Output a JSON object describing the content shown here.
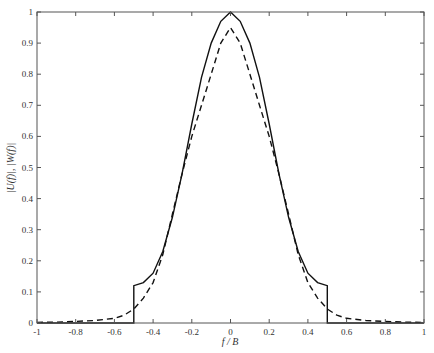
{
  "chart_data": {
    "type": "line",
    "title": "",
    "xlabel": "f / B",
    "ylabel": "|U(f)|, |W(f)|",
    "xlim": [
      -1,
      1
    ],
    "ylim": [
      0,
      1
    ],
    "grid": false,
    "legend": null,
    "xticks": [
      -1,
      -0.8,
      -0.6,
      -0.4,
      -0.2,
      0,
      0.2,
      0.4,
      0.6,
      0.8,
      1
    ],
    "xtick_labels": [
      "-1",
      "-0.8",
      "-0.6",
      "-0.4",
      "-0.2",
      "0",
      "0.2",
      "0.4",
      "0.6",
      "0.8",
      "1"
    ],
    "yticks": [
      0,
      0.1,
      0.2,
      0.3,
      0.4,
      0.5,
      0.6,
      0.7,
      0.8,
      0.9,
      1
    ],
    "ytick_labels": [
      "0",
      "0.1",
      "0.2",
      "0.3",
      "0.4",
      "0.5",
      "0.6",
      "0.7",
      "0.8",
      "0.9",
      "1"
    ],
    "series": [
      {
        "name": "|U(f)|",
        "style": "solid",
        "x": [
          -1,
          -0.5,
          -0.5,
          -0.45,
          -0.4,
          -0.35,
          -0.3,
          -0.25,
          -0.2,
          -0.15,
          -0.1,
          -0.05,
          0,
          0.05,
          0.1,
          0.15,
          0.2,
          0.25,
          0.3,
          0.35,
          0.4,
          0.45,
          0.5,
          0.5,
          1
        ],
        "values": [
          0,
          0,
          0.12,
          0.13,
          0.16,
          0.23,
          0.34,
          0.48,
          0.64,
          0.79,
          0.9,
          0.97,
          1.0,
          0.97,
          0.9,
          0.79,
          0.64,
          0.48,
          0.34,
          0.23,
          0.16,
          0.13,
          0.12,
          0,
          0
        ]
      },
      {
        "name": "|W(f)|",
        "style": "dashed",
        "x": [
          -1,
          -0.9,
          -0.8,
          -0.7,
          -0.6,
          -0.55,
          -0.5,
          -0.45,
          -0.4,
          -0.35,
          -0.3,
          -0.25,
          -0.2,
          -0.15,
          -0.1,
          -0.05,
          0,
          0.05,
          0.1,
          0.15,
          0.2,
          0.25,
          0.3,
          0.35,
          0.4,
          0.45,
          0.5,
          0.55,
          0.6,
          0.7,
          0.8,
          0.9,
          1
        ],
        "values": [
          0.002,
          0.003,
          0.005,
          0.008,
          0.015,
          0.025,
          0.045,
          0.08,
          0.13,
          0.22,
          0.35,
          0.48,
          0.6,
          0.7,
          0.8,
          0.9,
          0.95,
          0.9,
          0.8,
          0.7,
          0.6,
          0.48,
          0.35,
          0.22,
          0.13,
          0.08,
          0.045,
          0.025,
          0.015,
          0.008,
          0.005,
          0.003,
          0.002
        ]
      }
    ]
  },
  "axes": {
    "xlabel": "f / B",
    "ylabel": "|U(f)|, |W(f)|"
  }
}
